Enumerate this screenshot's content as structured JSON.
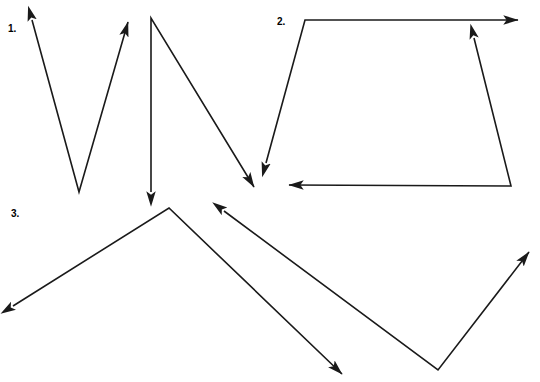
{
  "page": {
    "width": 540,
    "height": 382,
    "background_color": "#ffffff",
    "stroke_color": "#1a1a1a",
    "stroke_width": 1.6
  },
  "labels": [
    {
      "id": "1",
      "text": "1."
    },
    {
      "id": "2",
      "text": "2."
    },
    {
      "id": "3",
      "text": "3."
    }
  ],
  "chart_data": {
    "type": "diagram",
    "xlim": [
      0,
      540
    ],
    "ylim": [
      0,
      382
    ],
    "grid": false,
    "legend": "none",
    "figures": [
      {
        "label": "1.",
        "label_position": [
          8,
          29
        ],
        "paths": [
          {
            "name": "v-shape-left",
            "points": [
              [
                32,
                20
              ],
              [
                79,
                192
              ],
              [
                128,
                22
              ]
            ],
            "arrow_start": true,
            "arrow_end": true,
            "shape": "V"
          },
          {
            "name": "lambda-shape-right",
            "points": [
              [
                151,
                192
              ],
              [
                151,
                18
              ],
              [
                254,
                187
              ]
            ],
            "arrow_start": true,
            "arrow_end": true,
            "shape": "inverted-V"
          }
        ]
      },
      {
        "label": "2.",
        "label_position": [
          277,
          22
        ],
        "paths": [
          {
            "name": "trapezoid-upper-left-polyline",
            "points": [
              [
                266,
                163
              ],
              [
                305,
                20
              ],
              [
                518,
                20
              ]
            ],
            "arrow_start": true,
            "arrow_end": true,
            "shape": "bent-line"
          },
          {
            "name": "trapezoid-lower-right-polyline",
            "points": [
              [
                474,
                38
              ],
              [
                511,
                186
              ],
              [
                289,
                185
              ]
            ],
            "arrow_start": true,
            "arrow_end": true,
            "shape": "bent-line"
          }
        ]
      },
      {
        "label": "3.",
        "label_position": [
          11,
          214
        ],
        "paths": [
          {
            "name": "peak-polyline",
            "points": [
              [
                13,
                306
              ],
              [
                169,
                208
              ],
              [
                342,
                374
              ]
            ],
            "arrow_start": true,
            "arrow_end": true,
            "shape": "inverted-V"
          },
          {
            "name": "valley-polyline",
            "points": [
              [
                224,
                211
              ],
              [
                438,
                370
              ],
              [
                529,
                252
              ]
            ],
            "arrow_start": true,
            "arrow_end": true,
            "shape": "V"
          }
        ]
      }
    ]
  }
}
